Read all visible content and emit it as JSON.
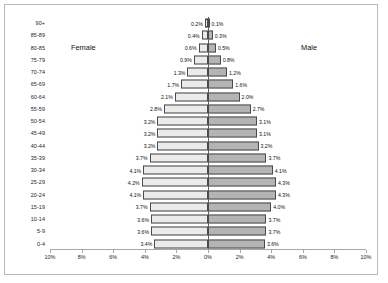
{
  "labels": {
    "female": "Female",
    "male": "Male"
  },
  "axis": {
    "xticks": [
      "10%",
      "8%",
      "6%",
      "4%",
      "2%",
      "0%",
      "2%",
      "4%",
      "6%",
      "8%",
      "10%"
    ]
  },
  "colors": {
    "female_fill": "#d6d6d6",
    "male_fill": "#b4b4b4",
    "bar_outline": "#4a4a4a",
    "axis_line": "#a8a8a8",
    "frame": "#b9b9b9",
    "text": "#111111"
  },
  "chart_data": {
    "type": "bar",
    "subtype": "population-pyramid",
    "orientation": "horizontal",
    "title": "",
    "xlabel": "",
    "ylabel": "",
    "xlim": [
      -10,
      10
    ],
    "xtick_values": [
      -10,
      -8,
      -6,
      -4,
      -2,
      0,
      2,
      4,
      6,
      8,
      10
    ],
    "xtick_labels": [
      "10%",
      "8%",
      "6%",
      "4%",
      "2%",
      "0%",
      "2%",
      "4%",
      "6%",
      "8%",
      "10%"
    ],
    "grid": false,
    "legend": [
      "Female",
      "Male"
    ],
    "legend_position": "inside-upper-left-and-upper-right",
    "categories": [
      "90+",
      "85-89",
      "80-85",
      "75-79",
      "70-74",
      "65-69",
      "60-64",
      "55-59",
      "50-54",
      "45-49",
      "40-44",
      "35-39",
      "30-34",
      "25-29",
      "20-24",
      "15-19",
      "10-14",
      "5-9",
      "0-4"
    ],
    "series": [
      {
        "name": "Female",
        "side": "left",
        "values": [
          0.2,
          0.4,
          0.6,
          0.9,
          1.3,
          1.7,
          2.1,
          2.8,
          3.2,
          3.2,
          3.2,
          3.7,
          4.1,
          4.2,
          4.1,
          3.7,
          3.6,
          3.6,
          3.4
        ],
        "labels": [
          "0.2%",
          "0.4%",
          "0.6%",
          "0.9%",
          "1.3%",
          "1.7%",
          "2.1%",
          "2.8%",
          "3.2%",
          "3.2%",
          "3.2%",
          "3.7%",
          "4.1%",
          "4.2%",
          "4.1%",
          "3.7%",
          "3.6%",
          "3.6%",
          "3.4%"
        ]
      },
      {
        "name": "Male",
        "side": "right",
        "values": [
          0.1,
          0.3,
          0.5,
          0.8,
          1.2,
          1.6,
          2.0,
          2.7,
          3.1,
          3.1,
          3.2,
          3.7,
          4.1,
          4.3,
          4.3,
          4.0,
          3.7,
          3.7,
          3.6
        ],
        "labels": [
          "0.1%",
          "0.3%",
          "0.5%",
          "0.8%",
          "1.2%",
          "1.6%",
          "2.0%",
          "2.7%",
          "3.1%",
          "3.1%",
          "3.2%",
          "3.7%",
          "4.1%",
          "4.3%",
          "4.3%",
          "4.0%",
          "3.7%",
          "3.7%",
          "3.6%"
        ]
      }
    ]
  }
}
